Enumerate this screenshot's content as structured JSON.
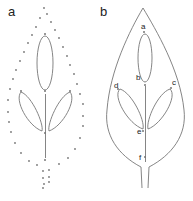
{
  "panels": [
    {
      "label": "a",
      "description": "Dotted leaf outline with central ellipse, midrib and two side leaflets"
    },
    {
      "label": "b",
      "description": "Solid leaf outline with petiole, central ellipse, midrib, two side leaflets and labeled points",
      "points": [
        {
          "label": "a"
        },
        {
          "label": "b"
        },
        {
          "label": "c"
        },
        {
          "label": "d"
        },
        {
          "label": "e"
        },
        {
          "label": "f"
        }
      ]
    }
  ],
  "colors": {
    "stroke": "#777777",
    "text": "#222222",
    "background": "#ffffff"
  }
}
